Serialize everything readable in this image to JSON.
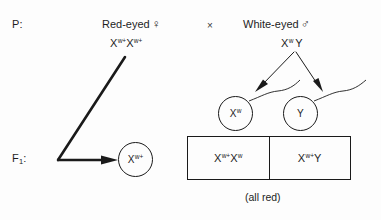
{
  "diagram": {
    "caption": "(all red)",
    "cross_symbol": "×",
    "generations": {
      "parental_label": "P",
      "parental_label_suffix": ":",
      "f1_label": "F",
      "f1_subscript": "1",
      "f1_label_suffix": ":"
    },
    "parents": [
      {
        "name": "mother",
        "phenotype": "Red-eyed",
        "sex_symbol": "♀",
        "genotype": {
          "allele1_base": "X",
          "allele1_sup": "w+",
          "allele2_base": "X",
          "allele2_sup": "w+"
        }
      },
      {
        "name": "father",
        "phenotype": "White-eyed",
        "sex_symbol": "♂",
        "genotype": {
          "allele1_base": "X",
          "allele1_sup": "w",
          "allele2_base": "Y",
          "allele2_sup": ""
        }
      }
    ],
    "gametes": {
      "egg": {
        "base": "X",
        "sup": "w+"
      },
      "sperm": [
        {
          "base": "X",
          "sup": "w"
        },
        {
          "base": "Y",
          "sup": ""
        }
      ]
    },
    "offspring": [
      {
        "name": "female-offspring",
        "allele1_base": "X",
        "allele1_sup": "w+",
        "allele2_base": "X",
        "allele2_sup": "w"
      },
      {
        "name": "male-offspring",
        "allele1_base": "X",
        "allele1_sup": "w+",
        "allele2_base": "Y",
        "allele2_sup": ""
      }
    ]
  },
  "colors": {
    "ink": "#1a1a1a",
    "background": "#fdfdfd"
  }
}
